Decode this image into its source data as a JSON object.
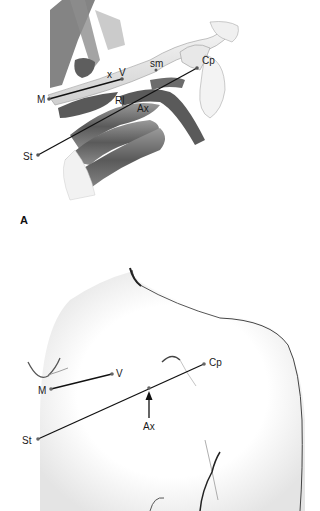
{
  "figure": {
    "panel_a": {
      "letter": "A",
      "description": "Anatomical illustration of clavicle, ribs, subclavian/axillary vessels",
      "labels": {
        "M": "M",
        "x": "x",
        "V": "V",
        "sm": "sm",
        "Cp": "Cp",
        "Rl": "Rl",
        "Ax": "Ax",
        "St": "St"
      }
    },
    "panel_b": {
      "description": "Surface anatomy of chest and shoulder with landmark lines",
      "labels": {
        "M": "M",
        "V": "V",
        "Cp": "Cp",
        "Ax": "Ax",
        "St": "St"
      }
    },
    "colors": {
      "line": "#111111",
      "muscle": "#7a7a7a",
      "bone": "#e6e6e6",
      "skin_outline": "#333333"
    }
  }
}
